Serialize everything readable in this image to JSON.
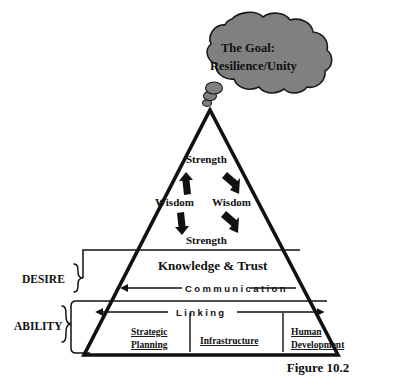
{
  "figure": {
    "caption": "Figure 10.2",
    "cloud": {
      "line1": "The Goal:",
      "line2": "Resilience/Unity",
      "fill_color": "#808080",
      "stroke_color": "#1a1a1a"
    },
    "pyramid": {
      "stroke_color": "#111111",
      "fill_color": "#ffffff"
    },
    "core_cycle": {
      "top": "Strength",
      "left": "Wisdom",
      "right": "Wisdom",
      "bottom": "Strength",
      "arrow_color": "#111111"
    },
    "bands": [
      {
        "title": "Knowledge & Trust",
        "flow_label": "Communication"
      },
      {
        "title": "",
        "flow_label": "Linking"
      }
    ],
    "columns": [
      {
        "line1": "Strategic",
        "line2": "Planning"
      },
      {
        "line1": "Infrastructure",
        "line2": ""
      },
      {
        "line1": "Human",
        "line2": "Development"
      }
    ],
    "side_labels": [
      {
        "label": "DESIRE"
      },
      {
        "label": "ABILITY"
      }
    ]
  }
}
